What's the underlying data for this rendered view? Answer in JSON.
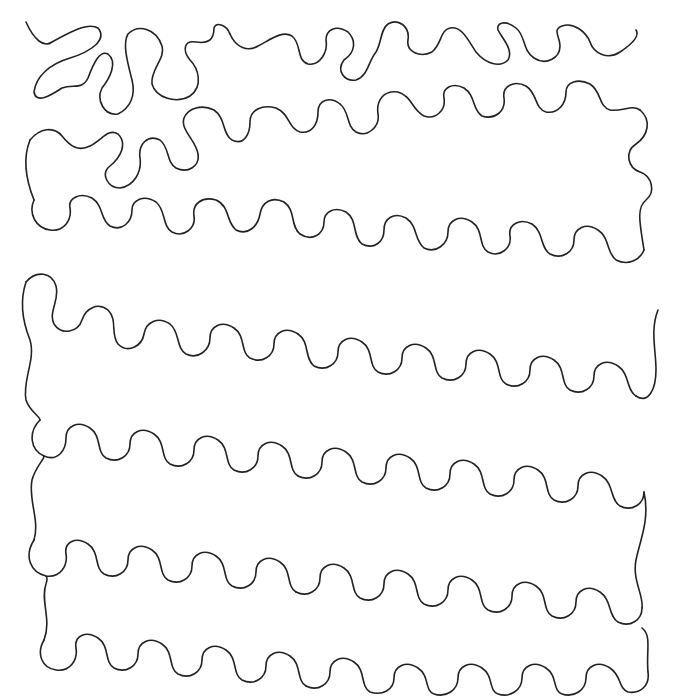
{
  "pattern": {
    "description": "Stipple / meander quilting pattern: single continuous wavy line on white background",
    "background_color": "#ffffff",
    "line_color": "#222222",
    "line_width": 1.6,
    "text": []
  }
}
